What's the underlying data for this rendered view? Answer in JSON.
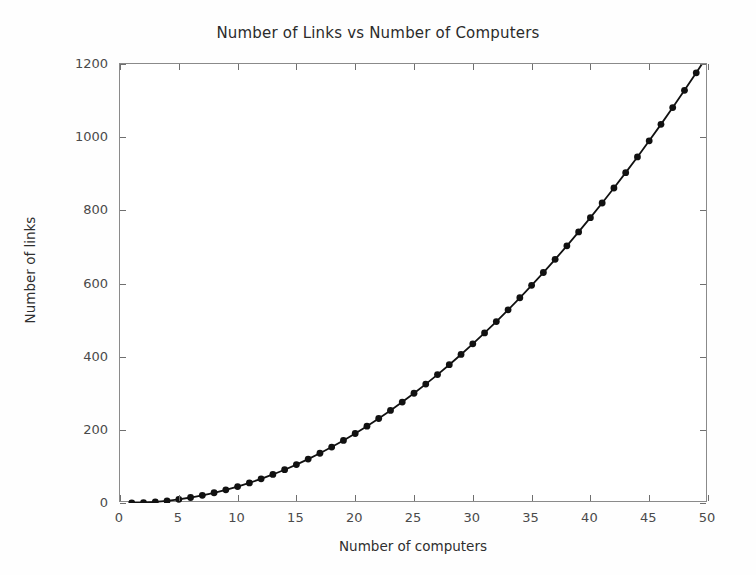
{
  "chart_data": {
    "type": "line",
    "title": "Number of Links vs Number of Computers",
    "xlabel": "Number of computers",
    "ylabel": "Number of links",
    "xlim": [
      0,
      50
    ],
    "ylim": [
      0,
      1200
    ],
    "grid": false,
    "legend": false,
    "marker": "circle",
    "marker_color": "#111111",
    "line_color": "#111111",
    "background_color": "#ffffff",
    "axes_color": "#8a8a8a",
    "xticks": [
      0,
      5,
      10,
      15,
      20,
      25,
      30,
      35,
      40,
      45,
      50
    ],
    "xtick_labels": [
      "0",
      "5",
      "10",
      "15",
      "20",
      "25",
      "30",
      "35",
      "40",
      "45",
      "50"
    ],
    "yticks": [
      0,
      200,
      400,
      600,
      800,
      1000,
      1200
    ],
    "ytick_labels": [
      "0",
      "200",
      "400",
      "600",
      "800",
      "1000",
      "1200"
    ],
    "series": [
      {
        "name": "links",
        "x": [
          1,
          2,
          3,
          4,
          5,
          6,
          7,
          8,
          9,
          10,
          11,
          12,
          13,
          14,
          15,
          16,
          17,
          18,
          19,
          20,
          21,
          22,
          23,
          24,
          25,
          26,
          27,
          28,
          29,
          30,
          31,
          32,
          33,
          34,
          35,
          36,
          37,
          38,
          39,
          40,
          41,
          42,
          43,
          44,
          45,
          46,
          47,
          48,
          49,
          50
        ],
        "values": [
          0,
          1,
          3,
          6,
          10,
          15,
          21,
          28,
          36,
          45,
          55,
          66,
          78,
          91,
          105,
          120,
          136,
          153,
          171,
          190,
          210,
          231,
          253,
          276,
          300,
          325,
          351,
          378,
          406,
          435,
          465,
          496,
          528,
          561,
          595,
          630,
          666,
          703,
          741,
          780,
          820,
          861,
          903,
          946,
          990,
          1035,
          1081,
          1128,
          1176,
          1225
        ]
      }
    ]
  }
}
